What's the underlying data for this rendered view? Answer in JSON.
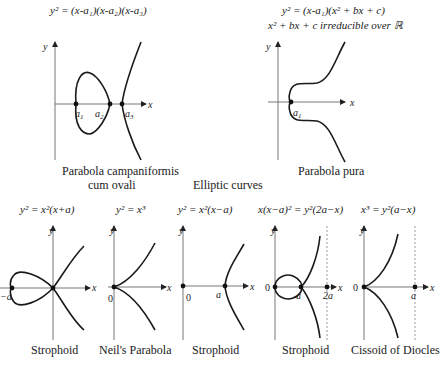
{
  "title": "Elliptic curves",
  "top": {
    "left": {
      "equation": "y² = (x-a₁)(x-a₂)(x-a₃)",
      "caption_line1": "Parabola campaniformis",
      "caption_line2": "cum ovali",
      "points": [
        "a₁",
        "a₂",
        "a₃"
      ],
      "axis_x": "x",
      "axis_y": "y"
    },
    "right": {
      "equation": "y² = (x-a₁)(x² + bx + c)",
      "condition": "x² + bx + c  irreducible over ℝ",
      "caption": "Parabola pura",
      "points": [
        "a₁"
      ],
      "axis_x": "x",
      "axis_y": "y"
    }
  },
  "bottom": [
    {
      "equation": "y² = x²(x+a)",
      "caption": "Strophoid",
      "labels": [
        "−a"
      ],
      "axis_x": "x",
      "axis_y": "y"
    },
    {
      "equation": "y² = x³",
      "caption": "Neil's Parabola",
      "labels": [
        "0"
      ],
      "axis_x": "x",
      "axis_y": "y"
    },
    {
      "equation": "y² = x²(x−a)",
      "caption": "Strophoid",
      "labels": [
        "0",
        "a"
      ],
      "axis_x": "x",
      "axis_y": "y"
    },
    {
      "equation": "x(x−a)² = y²(2a−x)",
      "caption": "Strophoid",
      "labels": [
        "0",
        "a",
        "2a"
      ],
      "axis_x": "x",
      "axis_y": "y"
    },
    {
      "equation": "x³ = y²(a−x)",
      "caption": "Cissoid of Diocles",
      "labels": [
        "0",
        "a"
      ],
      "axis_x": "x",
      "axis_y": "y"
    }
  ]
}
